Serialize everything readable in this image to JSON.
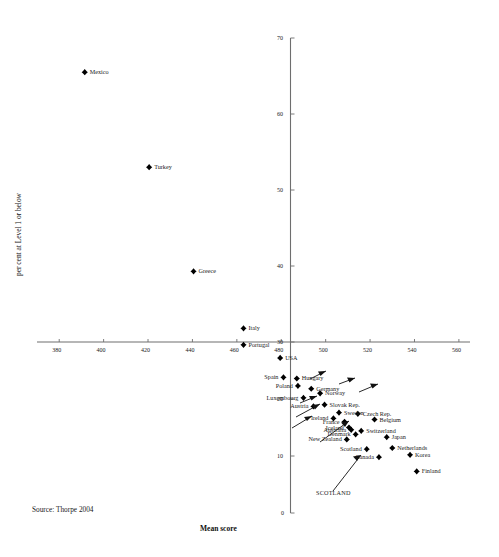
{
  "chart_data": {
    "type": "scatter",
    "title": "",
    "xlabel": "Mean score",
    "ylabel": "per cent at Level 1 or below",
    "xlim": [
      370,
      565
    ],
    "ylim": [
      0,
      70
    ],
    "xticks": [
      380,
      400,
      420,
      440,
      460,
      480,
      500,
      520,
      540,
      560
    ],
    "yticks": [
      0,
      10,
      20,
      30,
      40,
      50,
      60,
      70
    ],
    "grid": false,
    "legend": null,
    "marker": "filled-diamond",
    "points": [
      {
        "label": "Mexico",
        "x": 391.5,
        "y": 65.5
      },
      {
        "label": "Turkey",
        "x": 420.5,
        "y": 53.0
      },
      {
        "label": "Greece",
        "x": 440.5,
        "y": 39.3
      },
      {
        "label": "Italy",
        "x": 463.0,
        "y": 31.8
      },
      {
        "label": "Portugal",
        "x": 463.0,
        "y": 29.5
      },
      {
        "label": "USA",
        "x": 479.5,
        "y": 27.2
      },
      {
        "label": "Spain",
        "x": 481.0,
        "y": 23.8
      },
      {
        "label": "Hungary",
        "x": 487.0,
        "y": 23.6
      },
      {
        "label": "Poland",
        "x": 487.5,
        "y": 22.3
      },
      {
        "label": "Germany",
        "x": 493.5,
        "y": 21.8
      },
      {
        "label": "Norway",
        "x": 497.5,
        "y": 21.0
      },
      {
        "label": "Luxembourg",
        "x": 490.0,
        "y": 20.2
      },
      {
        "label": "Slovak Rep.",
        "x": 499.5,
        "y": 19.0
      },
      {
        "label": "Austria",
        "x": 494.5,
        "y": 18.7
      },
      {
        "label": "Sweden",
        "x": 506.0,
        "y": 17.6
      },
      {
        "label": "Czech Rep.",
        "x": 514.5,
        "y": 17.4
      },
      {
        "label": "Ireland",
        "x": 503.5,
        "y": 16.6
      },
      {
        "label": "Belgium",
        "x": 522.0,
        "y": 16.4
      },
      {
        "label": "France",
        "x": 508.5,
        "y": 16.0
      },
      {
        "label": "Iceland",
        "x": 510.5,
        "y": 15.0
      },
      {
        "label": "Australia",
        "x": 511.5,
        "y": 14.6
      },
      {
        "label": "Switzerland",
        "x": 516.0,
        "y": 14.4
      },
      {
        "label": "Denmark",
        "x": 513.5,
        "y": 13.8
      },
      {
        "label": "Japan",
        "x": 527.5,
        "y": 13.3
      },
      {
        "label": "New Zealand",
        "x": 509.5,
        "y": 12.9
      },
      {
        "label": "Netherlands",
        "x": 530.0,
        "y": 11.4
      },
      {
        "label": "Scotland",
        "x": 518.5,
        "y": 11.2
      },
      {
        "label": "Korea",
        "x": 538.0,
        "y": 10.2
      },
      {
        "label": "Canada",
        "x": 524.0,
        "y": 9.8
      },
      {
        "label": "Finland",
        "x": 541.0,
        "y": 7.3
      }
    ],
    "annotations": [
      {
        "text": "SCOTLAND",
        "note": "leader arrow pointing to the Scotland data point"
      }
    ]
  },
  "footer": {
    "source": "Source: Thorpe 2004"
  },
  "callout": {
    "scotland": "SCOTLAND"
  },
  "axes": {
    "x_title": "Mean score",
    "y_title": "per cent at Level 1 or below"
  }
}
